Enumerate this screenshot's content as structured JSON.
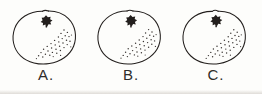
{
  "page": {
    "background_color": "#fdfdfb",
    "ink_color": "#231f1d",
    "width": 262,
    "height": 94
  },
  "background_bleed_text": {
    "note": "Illegible faint show-through text from the reverse side of the paper",
    "line1": " ",
    "line2": " ",
    "line3": " ",
    "line4": " "
  },
  "figures": [
    {
      "id": "figure-a",
      "label": "A.",
      "object_name": "orange-fruit",
      "stem_icon": "star-calyx-icon",
      "shading": "stipple-dots",
      "shading_side": "lower-right"
    },
    {
      "id": "figure-b",
      "label": "B.",
      "object_name": "orange-fruit",
      "stem_icon": "star-calyx-icon",
      "shading": "stipple-dots",
      "shading_side": "lower-right"
    },
    {
      "id": "figure-c",
      "label": "C.",
      "object_name": "orange-fruit",
      "stem_icon": "star-calyx-icon",
      "shading": "stipple-dots",
      "shading_side": "lower-right"
    }
  ]
}
